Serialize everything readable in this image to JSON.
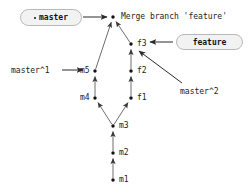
{
  "diagram": {
    "title_text": "Merge branch 'feature'",
    "type": "git-commit-graph",
    "background_color": "#ffffff",
    "line_color": "#6e6e6e",
    "node_color": "#111111",
    "pill_fill": "#f2f2f2",
    "pill_border": "#b8b8b8"
  },
  "refs": [
    {
      "id": "ref-master",
      "label": "master",
      "bullet": true,
      "x": 20,
      "y": 9,
      "w": 62,
      "h": 17
    },
    {
      "id": "ref-feature",
      "label": "feature",
      "bullet": false,
      "x": 176,
      "y": 34,
      "w": 67,
      "h": 16
    }
  ],
  "commits": [
    {
      "id": "merge",
      "label": "Merge branch 'feature'",
      "x": 113,
      "y": 17,
      "label_x": 121,
      "label_y": 12
    },
    {
      "id": "f3",
      "label": "f3",
      "x": 131,
      "y": 44,
      "label_x": 137,
      "label_y": 39
    },
    {
      "id": "f2",
      "label": "f2",
      "x": 131,
      "y": 71,
      "label_x": 137,
      "label_y": 66
    },
    {
      "id": "f1",
      "label": "f1",
      "x": 131,
      "y": 98,
      "label_x": 137,
      "label_y": 93
    },
    {
      "id": "m5",
      "label": "m5",
      "x": 95,
      "y": 71,
      "label_x": 80,
      "label_y": 66
    },
    {
      "id": "m4",
      "label": "m4",
      "x": 95,
      "y": 98,
      "label_x": 80,
      "label_y": 93
    },
    {
      "id": "m3",
      "label": "m3",
      "x": 113,
      "y": 126,
      "label_x": 119,
      "label_y": 121
    },
    {
      "id": "m2",
      "label": "m2",
      "x": 113,
      "y": 153,
      "label_x": 119,
      "label_y": 148
    },
    {
      "id": "m1",
      "label": "m1",
      "x": 113,
      "y": 180,
      "label_x": 119,
      "label_y": 175
    }
  ],
  "edges": [
    {
      "from": "m5",
      "to": "merge"
    },
    {
      "from": "f3",
      "to": "merge"
    },
    {
      "from": "m4",
      "to": "m5"
    },
    {
      "from": "f2",
      "to": "f3"
    },
    {
      "from": "f1",
      "to": "f2"
    },
    {
      "from": "m3",
      "to": "m4"
    },
    {
      "from": "m3",
      "to": "f1"
    },
    {
      "from": "m2",
      "to": "m3"
    },
    {
      "from": "m1",
      "to": "m2"
    }
  ],
  "annotations": [
    {
      "id": "annot-master1",
      "label": "master^1",
      "x": 11,
      "y": 66
    },
    {
      "id": "annot-master2",
      "label": "master^2",
      "x": 180,
      "y": 87
    }
  ],
  "pointers": [
    {
      "id": "pointer-master-to-merge",
      "x1": 83,
      "y1": 17,
      "x2": 107,
      "y2": 17
    },
    {
      "id": "pointer-feature-to-f3",
      "x1": 173,
      "y1": 42,
      "x2": 150,
      "y2": 42
    },
    {
      "id": "pointer-master1-to-m5",
      "x1": 62,
      "y1": 70,
      "x2": 83,
      "y2": 70
    },
    {
      "id": "pointer-master2-to-f3",
      "x1": 182,
      "y1": 83,
      "x2": 139,
      "y2": 51
    }
  ]
}
